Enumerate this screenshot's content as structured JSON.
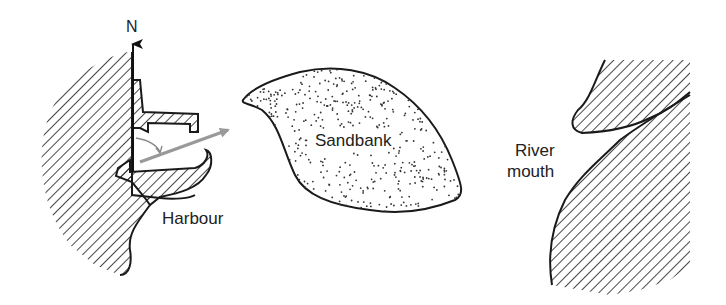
{
  "labels": {
    "north": "N",
    "sandbank": "Sandbank",
    "harbour": "Harbour",
    "river_line1": "River",
    "river_line2": "mouth"
  },
  "colors": {
    "ink": "#1a1a1a",
    "bearing_arrow": "#999999",
    "angle_arc": "#8a8a8a",
    "background": "#ffffff"
  },
  "features": [
    {
      "name": "coastline-west",
      "fill": "hatched"
    },
    {
      "name": "harbour-breakwaters",
      "fill": "hatched"
    },
    {
      "name": "sandbank",
      "fill": "stippled"
    },
    {
      "name": "river-bank-east",
      "fill": "hatched"
    }
  ]
}
